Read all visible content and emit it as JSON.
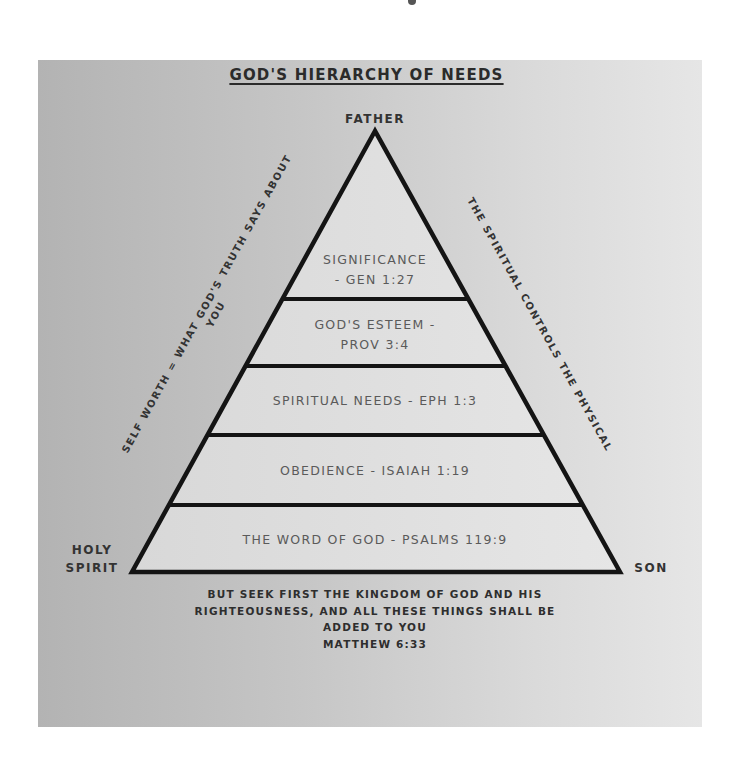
{
  "title": "GOD'S HIERARCHY OF NEEDS",
  "vertices": {
    "top": "FATHER",
    "bottom_left_line1": "HOLY",
    "bottom_left_line2": "SPIRIT",
    "bottom_right": "SON"
  },
  "levels": [
    {
      "line1": "SIGNIFICANCE",
      "line2": "- GEN 1:27"
    },
    {
      "line1": "GOD'S ESTEEM -",
      "line2": "PROV 3:4"
    },
    {
      "line1": "SPIRITUAL NEEDS - EPH 1:3"
    },
    {
      "line1": "OBEDIENCE - ISAIAH 1:19"
    },
    {
      "line1": "THE WORD OF GOD - PSALMS 119:9"
    }
  ],
  "side_labels": {
    "left_line1": "SELF WORTH = WHAT GOD'S TRUTH SAYS ABOUT",
    "left_line2": "YOU",
    "right": "THE SPIRITUAL CONTROLS THE PHYSICAL"
  },
  "quote": {
    "line1": "BUT SEEK FIRST THE KINGDOM OF GOD AND HIS",
    "line2": "RIGHTEOUSNESS, AND ALL THESE THINGS SHALL BE",
    "line3": "ADDED TO YOU",
    "reference": "MATTHEW 6:33"
  },
  "colors": {
    "outline": "#141414",
    "pyramid_fill": "#dedede",
    "text_dark": "#2b2b2b",
    "text_level": "#5a5a5a"
  }
}
